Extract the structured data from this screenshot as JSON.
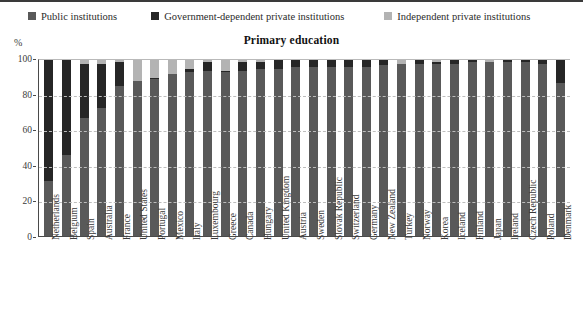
{
  "legend": {
    "items": [
      {
        "label": "Public institutions",
        "color": "#595959",
        "name": "legend-public"
      },
      {
        "label": "Government-dependent private institutions",
        "color": "#262626",
        "name": "legend-gov-dependent"
      },
      {
        "label": "Independent private institutions",
        "color": "#b3b3b3",
        "name": "legend-independent"
      }
    ]
  },
  "axis": {
    "unit_label": "%",
    "yticks": [
      "100",
      "80",
      "60",
      "40",
      "20",
      "0"
    ]
  },
  "chart_data": {
    "type": "bar",
    "title": "Primary education",
    "xlabel": "",
    "ylabel": "%",
    "ylim": [
      0,
      100
    ],
    "stacked": true,
    "grid": true,
    "legend_position": "top",
    "categories": [
      "Netherlands",
      "Belgium",
      "Spain",
      "Australia",
      "France",
      "United States",
      "Portugal",
      "Mexico",
      "Italy",
      "Luxembourg",
      "Greece",
      "Canada",
      "Hungary",
      "United Kingdom",
      "Austria",
      "Sweden",
      "Slovak Republic",
      "Switzerland",
      "Germany",
      "New Zealand",
      "Turkey",
      "Norway",
      "Korea",
      "Iceland",
      "Finland",
      "Japan",
      "Ireland",
      "Czech Republic",
      "Poland",
      "Denmark"
    ],
    "series": [
      {
        "name": "Public institutions",
        "color": "#595959",
        "values": [
          31,
          46,
          67,
          73,
          85,
          88,
          89,
          92,
          93,
          94,
          93,
          94,
          95,
          95,
          96,
          96,
          96,
          96,
          96,
          97,
          98,
          98,
          98,
          98,
          99,
          99,
          99,
          99,
          98,
          87
        ]
      },
      {
        "name": "Government-dependent private institutions",
        "color": "#262626",
        "values": [
          69,
          54,
          31,
          25,
          14,
          0,
          1,
          0,
          2,
          5,
          1,
          5,
          4,
          5,
          4,
          4,
          4,
          4,
          4,
          3,
          0,
          2,
          1,
          2,
          1,
          0,
          1,
          1,
          2,
          13
        ]
      },
      {
        "name": "Independent private institutions",
        "color": "#b3b3b3",
        "values": [
          0,
          0,
          2,
          2,
          1,
          12,
          10,
          8,
          5,
          1,
          6,
          1,
          1,
          0,
          0,
          0,
          0,
          0,
          0,
          0,
          2,
          0,
          1,
          0,
          0,
          1,
          0,
          0,
          0,
          0
        ]
      }
    ]
  }
}
